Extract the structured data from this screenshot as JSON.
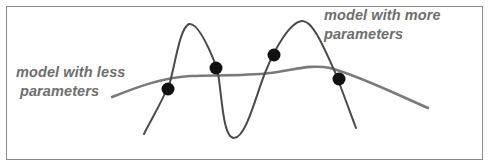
{
  "diagram": {
    "title": "",
    "labels": {
      "less_params": {
        "line1": "model with less",
        "line2": "parameters"
      },
      "more_params": {
        "line1": "model with more",
        "line2": "parameters"
      }
    },
    "colors": {
      "frame_border": "#8a8a8a",
      "label_text": "#6e6e6e",
      "smooth_curve": "#7a7a7a",
      "wiggly_curve": "#4a4a4a",
      "data_point": "#111111",
      "background": "#ffffff"
    },
    "curves": [
      {
        "name": "model-with-less-parameters",
        "description": "smooth low-complexity fit"
      },
      {
        "name": "model-with-more-parameters",
        "description": "wiggly high-complexity fit passing through all points"
      }
    ],
    "data_points": [
      {
        "x": 168,
        "y": 89
      },
      {
        "x": 216,
        "y": 68
      },
      {
        "x": 274,
        "y": 55
      },
      {
        "x": 339,
        "y": 79
      }
    ]
  }
}
